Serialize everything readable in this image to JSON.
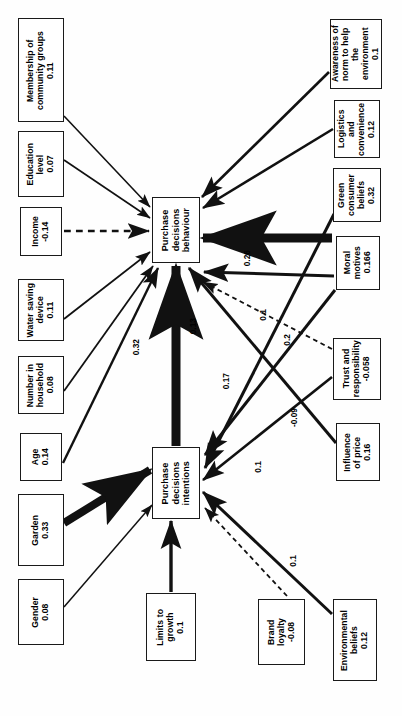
{
  "diagram": {
    "type": "path-diagram",
    "orientation": "rotated-90-ccw",
    "nodes": [
      {
        "id": "membership",
        "label": "Membership of\ncommunity groups",
        "value": "0.11",
        "text": "Membership of\ncommunity groups\n0.11",
        "x": 18,
        "y": 18,
        "w": 46,
        "h": 104
      },
      {
        "id": "education",
        "label": "Education\nlevel",
        "value": "0.07",
        "text": "Education\nlevel\n0.07",
        "x": 18,
        "y": 131,
        "w": 46,
        "h": 66
      },
      {
        "id": "income",
        "label": "Income",
        "value": "-0.14",
        "text": "Income\n-0.14",
        "x": 20,
        "y": 207,
        "w": 42,
        "h": 49
      },
      {
        "id": "water-saving-device",
        "label": "Water saving\ndevice",
        "value": "0.11",
        "text": "Water saving\ndevice\n0.11",
        "x": 18,
        "y": 279,
        "w": 46,
        "h": 62
      },
      {
        "id": "number-in-household",
        "label": "Number in\nhousehold",
        "value": "0.08",
        "text": "Number in\nhousehold\n0.08",
        "x": 18,
        "y": 356,
        "w": 46,
        "h": 58
      },
      {
        "id": "age",
        "label": "Age",
        "value": "0.14",
        "text": "Age\n0.14",
        "x": 20,
        "y": 433,
        "w": 42,
        "h": 48
      },
      {
        "id": "garden",
        "label": "Garden",
        "value": "0.33",
        "text": "Garden\n0.33",
        "x": 18,
        "y": 494,
        "w": 46,
        "h": 72
      },
      {
        "id": "gender",
        "label": "Gender",
        "value": "0.08",
        "text": "Gender\n0.08",
        "x": 18,
        "y": 579,
        "w": 46,
        "h": 66
      },
      {
        "id": "purchase-decisions-behaviour",
        "label": "Purchase\ndecisions\nbehaviour",
        "value": "",
        "text": "Purchase\ndecisions\nbehaviour",
        "x": 152,
        "y": 197,
        "w": 48,
        "h": 66
      },
      {
        "id": "purchase-decisions-intentions",
        "label": "Purchase\ndecisions\nintentions",
        "value": "",
        "text": "Purchase\ndecisions\nintentions",
        "x": 152,
        "y": 447,
        "w": 48,
        "h": 72
      },
      {
        "id": "limits-to-growth",
        "label": "Limits to\ngrowth",
        "value": "0.1",
        "text": "Limits to\ngrowth\n0.1",
        "x": 146,
        "y": 593,
        "w": 50,
        "h": 68
      },
      {
        "id": "awareness-of-norm",
        "label": "Awareness of\nnorm to help the\nenvironment",
        "value": "0.1",
        "text": "Awareness of\nnorm to help the\nenvironment\n0.1",
        "x": 330,
        "y": 19,
        "w": 52,
        "h": 70
      },
      {
        "id": "logistics-and-convenience",
        "label": "Logistics and\nconvenience",
        "value": "0.12",
        "text": "Logistics and\nconvenience\n0.12",
        "x": 334,
        "y": 100,
        "w": 46,
        "h": 58
      },
      {
        "id": "green-consumer-beliefs",
        "label": "Green\nconsumer\nbeliefs",
        "value": "0.32",
        "text": "Green\nconsumer\nbeliefs\n0.32",
        "x": 333,
        "y": 168,
        "w": 48,
        "h": 54
      },
      {
        "id": "moral-motives",
        "label": "Moral\nmotives",
        "value": "0.166",
        "text": "Moral\nmotives\n0.166",
        "x": 336,
        "y": 236,
        "w": 44,
        "h": 54
      },
      {
        "id": "trust-and-responsibility",
        "label": "Trust and\nresponsibility",
        "value": "-0.058",
        "text": "Trust and\nresponsibility\n-0.058",
        "x": 333,
        "y": 338,
        "w": 48,
        "h": 62
      },
      {
        "id": "influence-of-price",
        "label": "Influence\nof price",
        "value": "0.16",
        "text": "Influence\nof price\n0.16",
        "x": 336,
        "y": 423,
        "w": 44,
        "h": 58
      },
      {
        "id": "brand-loyalty",
        "label": "Brand\nloyalty",
        "value": "-0.08",
        "text": "Brand\nloyalty\n-0.08",
        "x": 258,
        "y": 599,
        "w": 47,
        "h": 66
      },
      {
        "id": "environmental-beliefs",
        "label": "Environmental\nbeliefs",
        "value": "0.12",
        "text": "Environmental\nbeliefs\n0.12",
        "x": 333,
        "y": 599,
        "w": 44,
        "h": 82
      }
    ],
    "edges": [
      {
        "id": "membership-to-behaviour",
        "from": "membership",
        "to": "purchase-decisions-behaviour",
        "style": "solid",
        "weight": 1.6,
        "label": "",
        "x1": 64,
        "y1": 116,
        "x2": 150,
        "y2": 207
      },
      {
        "id": "education-to-behaviour",
        "from": "education",
        "to": "purchase-decisions-behaviour",
        "style": "solid",
        "weight": 1.6,
        "label": "",
        "x1": 64,
        "y1": 160,
        "x2": 150,
        "y2": 218
      },
      {
        "id": "income-to-behaviour",
        "from": "income",
        "to": "purchase-decisions-behaviour",
        "style": "dashed",
        "weight": 2.6,
        "label": "",
        "x1": 64,
        "y1": 231,
        "x2": 149,
        "y2": 231
      },
      {
        "id": "water-saving-to-behaviour",
        "from": "water-saving-device",
        "to": "purchase-decisions-behaviour",
        "style": "solid",
        "weight": 1.8,
        "label": "",
        "x1": 64,
        "y1": 319,
        "x2": 150,
        "y2": 252
      },
      {
        "id": "household-to-behaviour",
        "from": "number-in-household",
        "to": "purchase-decisions-behaviour",
        "style": "solid",
        "weight": 1.8,
        "label": "",
        "x1": 64,
        "y1": 391,
        "x2": 153,
        "y2": 266
      },
      {
        "id": "age-to-behaviour",
        "from": "age",
        "to": "purchase-decisions-behaviour",
        "style": "solid",
        "weight": 2.4,
        "label": "",
        "x1": 63,
        "y1": 463,
        "x2": 158,
        "y2": 268
      },
      {
        "id": "garden-to-intentions",
        "from": "garden",
        "to": "purchase-decisions-intentions",
        "style": "solid",
        "weight": 8,
        "label": "",
        "x1": 64,
        "y1": 523,
        "x2": 150,
        "y2": 470
      },
      {
        "id": "gender-to-intentions",
        "from": "gender",
        "to": "purchase-decisions-intentions",
        "style": "solid",
        "weight": 1.5,
        "label": "",
        "x1": 64,
        "y1": 607,
        "x2": 152,
        "y2": 505
      },
      {
        "id": "intentions-to-behaviour",
        "from": "purchase-decisions-intentions",
        "to": "purchase-decisions-behaviour",
        "style": "solid",
        "weight": 9,
        "label": "0.32",
        "x1": 176,
        "y1": 446,
        "x2": 176,
        "y2": 266
      },
      {
        "id": "limits-to-growth-to-intentions",
        "from": "limits-to-growth",
        "to": "purchase-decisions-intentions",
        "style": "solid",
        "weight": 3.4,
        "label": "",
        "x1": 171,
        "y1": 592,
        "x2": 171,
        "y2": 521
      },
      {
        "id": "awareness-to-behaviour",
        "from": "awareness-of-norm",
        "to": "purchase-decisions-behaviour",
        "style": "solid",
        "weight": 2.6,
        "label": "",
        "x1": 329,
        "y1": 72,
        "x2": 202,
        "y2": 197
      },
      {
        "id": "logistics-to-behaviour",
        "from": "logistics-and-convenience",
        "to": "purchase-decisions-behaviour",
        "style": "solid",
        "weight": 2.6,
        "label": "",
        "x1": 333,
        "y1": 129,
        "x2": 203,
        "y2": 208
      },
      {
        "id": "green-beliefs-to-behaviour",
        "from": "green-consumer-beliefs",
        "to": "purchase-decisions-behaviour",
        "style": "solid",
        "weight": 9,
        "label": "0.26",
        "x1": 332,
        "y1": 238,
        "x2": 203,
        "y2": 238
      },
      {
        "id": "green-beliefs-to-intentions",
        "from": "green-consumer-beliefs",
        "to": "purchase-decisions-intentions",
        "style": "solid",
        "weight": 3,
        "label": "0.17",
        "x1": 334,
        "y1": 214,
        "x2": 205,
        "y2": 468
      },
      {
        "id": "moral-motives-to-behaviour",
        "from": "moral-motives",
        "to": "purchase-decisions-behaviour",
        "style": "solid",
        "weight": 3,
        "label": "0.1",
        "x1": 334,
        "y1": 276,
        "x2": 204,
        "y2": 272
      },
      {
        "id": "moral-motives-to-intentions",
        "from": "moral-motives",
        "to": "purchase-decisions-intentions",
        "style": "solid",
        "weight": 3,
        "label": "0.2",
        "x1": 335,
        "y1": 290,
        "x2": 205,
        "y2": 455
      },
      {
        "id": "trust-to-behaviour",
        "from": "trust-and-responsibility",
        "to": "purchase-decisions-behaviour",
        "style": "dashed",
        "weight": 1.8,
        "label": "-0.09",
        "x1": 332,
        "y1": 349,
        "x2": 203,
        "y2": 282
      },
      {
        "id": "trust-to-intentions",
        "from": "trust-and-responsibility",
        "to": "purchase-decisions-intentions",
        "style": "solid",
        "weight": 2.6,
        "label": "0.1",
        "x1": 332,
        "y1": 377,
        "x2": 203,
        "y2": 480
      },
      {
        "id": "influence-of-price-to-behaviour",
        "from": "influence-of-price",
        "to": "purchase-decisions-behaviour",
        "style": "solid",
        "weight": 3,
        "label": "0.13",
        "x1": 336,
        "y1": 443,
        "x2": 189,
        "y2": 268
      },
      {
        "id": "environmental-beliefs-to-intentions",
        "from": "environmental-beliefs",
        "to": "purchase-decisions-intentions",
        "style": "solid",
        "weight": 3,
        "label": "0.1",
        "x1": 332,
        "y1": 614,
        "x2": 203,
        "y2": 492
      },
      {
        "id": "brand-loyalty-to-intentions",
        "from": "brand-loyalty",
        "to": "purchase-decisions-intentions",
        "style": "dashed",
        "weight": 1.8,
        "label": "",
        "x1": 287,
        "y1": 596,
        "x2": 205,
        "y2": 508
      }
    ],
    "edge_labels": [
      {
        "id": "label-0-32",
        "text": "0.32",
        "x": 131,
        "y": 339
      },
      {
        "id": "label-0-13",
        "text": "0.13",
        "x": 188,
        "y": 318
      },
      {
        "id": "label-0-17",
        "text": "0.17",
        "x": 221,
        "y": 373
      },
      {
        "id": "label-0-26",
        "text": "0.26",
        "x": 242,
        "y": 250
      },
      {
        "id": "label-0-1-moral",
        "text": "0.1",
        "x": 258,
        "y": 309
      },
      {
        "id": "label-0-2",
        "text": "0.2",
        "x": 282,
        "y": 334
      },
      {
        "id": "label-neg-0-09",
        "text": "-0.09",
        "x": 289,
        "y": 408
      },
      {
        "id": "label-0-1-trust",
        "text": "0.1",
        "x": 253,
        "y": 461
      },
      {
        "id": "label-0-1-env",
        "text": "0.1",
        "x": 288,
        "y": 555
      }
    ]
  }
}
